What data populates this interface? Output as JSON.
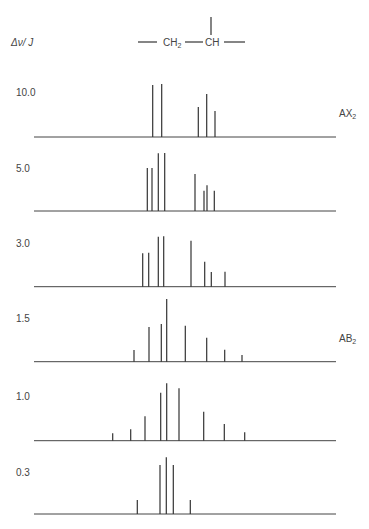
{
  "header": {
    "axis_label": "Δν/ J",
    "structure": {
      "group1": "CH",
      "group1_sub": "2",
      "group2": "CH"
    }
  },
  "chart_data": {
    "type": "stick-spectrum",
    "ylabel": "Δν/ J",
    "annotations": [
      {
        "panel": 0,
        "text": "AX",
        "sub": "2"
      },
      {
        "panel": 3,
        "text": "AB",
        "sub": "2"
      }
    ],
    "panels": [
      {
        "label": "10.0",
        "baseline_y": 137,
        "lines": [
          {
            "x": 152.7,
            "top": 85
          },
          {
            "x": 161.7,
            "top": 84
          },
          {
            "x": 198.3,
            "top": 107
          },
          {
            "x": 206.7,
            "top": 94
          },
          {
            "x": 215.0,
            "top": 111
          }
        ]
      },
      {
        "label": "5.0",
        "baseline_y": 211,
        "lines": [
          {
            "x": 147.3,
            "top": 168
          },
          {
            "x": 152.0,
            "top": 168
          },
          {
            "x": 158.3,
            "top": 153.3
          },
          {
            "x": 164.7,
            "top": 153
          },
          {
            "x": 195.0,
            "top": 174
          },
          {
            "x": 204.0,
            "top": 190.7
          },
          {
            "x": 207.0,
            "top": 185.3
          },
          {
            "x": 214.3,
            "top": 190.7
          }
        ]
      },
      {
        "label": "3.0",
        "baseline_y": 286.7,
        "lines": [
          {
            "x": 142.7,
            "top": 253.3
          },
          {
            "x": 148.7,
            "top": 252.7
          },
          {
            "x": 158.3,
            "top": 236.7
          },
          {
            "x": 163.7,
            "top": 236.3
          },
          {
            "x": 191.0,
            "top": 240.7
          },
          {
            "x": 204.7,
            "top": 261.7
          },
          {
            "x": 211.3,
            "top": 272
          },
          {
            "x": 225.0,
            "top": 271.7
          }
        ]
      },
      {
        "label": "1.5",
        "baseline_y": 361.7,
        "lines": [
          {
            "x": 134.0,
            "top": 350
          },
          {
            "x": 149.0,
            "top": 327
          },
          {
            "x": 161.3,
            "top": 324
          },
          {
            "x": 166.7,
            "top": 299
          },
          {
            "x": 185.3,
            "top": 325.7
          },
          {
            "x": 206.7,
            "top": 337.7
          },
          {
            "x": 224.7,
            "top": 349.7
          },
          {
            "x": 242.0,
            "top": 355
          }
        ]
      },
      {
        "label": "1.0",
        "baseline_y": 440.7,
        "lines": [
          {
            "x": 112.7,
            "top": 433.3
          },
          {
            "x": 130.7,
            "top": 429.3
          },
          {
            "x": 145.0,
            "top": 416.3
          },
          {
            "x": 160.7,
            "top": 392.7
          },
          {
            "x": 166.7,
            "top": 383.3
          },
          {
            "x": 179.0,
            "top": 388.3
          },
          {
            "x": 203.7,
            "top": 411.7
          },
          {
            "x": 224.3,
            "top": 424
          },
          {
            "x": 244.7,
            "top": 432.3
          }
        ]
      },
      {
        "label": "0.3",
        "baseline_y": 514,
        "lines": [
          {
            "x": 137.3,
            "top": 500
          },
          {
            "x": 160.0,
            "top": 465
          },
          {
            "x": 166.3,
            "top": 457.3
          },
          {
            "x": 173.3,
            "top": 465
          },
          {
            "x": 190.3,
            "top": 500
          }
        ]
      }
    ],
    "baseline_x": [
      34,
      336
    ],
    "label_x": 16,
    "label_y_offsets": [
      -41,
      -39,
      -40,
      -40,
      -41,
      -38
    ]
  }
}
